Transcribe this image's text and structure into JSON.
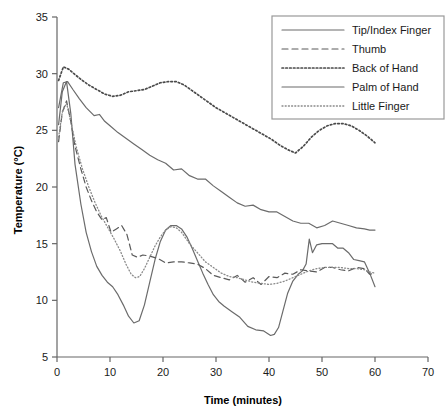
{
  "chart_data": {
    "type": "line",
    "title": "",
    "xlabel": "Time (minutes)",
    "ylabel": "Temperature (°C)",
    "xlim": [
      0,
      70
    ],
    "ylim": [
      5,
      35
    ],
    "xticks": [
      "0",
      "10",
      "20",
      "30",
      "40",
      "50",
      "60",
      "70"
    ],
    "xtick_values": [
      0,
      10,
      20,
      30,
      40,
      50,
      60,
      70
    ],
    "yticks": [
      "5",
      "10",
      "15",
      "20",
      "25",
      "30",
      "35"
    ],
    "ytick_values": [
      5,
      10,
      15,
      20,
      25,
      30,
      35
    ],
    "grid": false,
    "legend_position": "top-right",
    "series": [
      {
        "name": "Tip/Index Finger",
        "style": "solid",
        "color": "#6b6b6b",
        "x": [
          0.3,
          1.0,
          1.8,
          2.6,
          3.4,
          4.5,
          5.5,
          6.5,
          7.5,
          8.5,
          9.5,
          10.5,
          11.5,
          12.5,
          13.5,
          14.5,
          15.5,
          16.5,
          17.5,
          18.5,
          19.5,
          20.5,
          21.5,
          22.5,
          23.5,
          24.5,
          25.5,
          26.5,
          27.5,
          28.5,
          29.5,
          30.5,
          31.5,
          33.0,
          34.5,
          36.0,
          37.5,
          39.0,
          40.3,
          41.0,
          41.8,
          42.6,
          43.5,
          44.5,
          45.5,
          46.3,
          47.0,
          47.6,
          48.2,
          49.0,
          50.0,
          51.0,
          52.0,
          53.0,
          54.0,
          55.0,
          56.0,
          57.0,
          58.0,
          59.0,
          60.0
        ],
        "y": [
          25.5,
          28.4,
          29.3,
          26.5,
          22.0,
          18.5,
          16.0,
          14.3,
          13.0,
          12.2,
          11.6,
          11.2,
          10.5,
          9.6,
          8.6,
          8.0,
          8.2,
          9.6,
          11.6,
          13.6,
          15.2,
          16.2,
          16.6,
          16.6,
          16.3,
          15.6,
          14.6,
          13.5,
          12.4,
          11.4,
          10.5,
          9.9,
          9.5,
          9.0,
          8.5,
          7.7,
          7.4,
          7.3,
          6.9,
          7.0,
          7.6,
          9.0,
          10.6,
          11.7,
          12.3,
          12.6,
          13.2,
          15.4,
          14.2,
          14.9,
          15.0,
          15.0,
          15.0,
          14.6,
          14.6,
          14.2,
          13.6,
          13.5,
          13.4,
          12.4,
          11.2
        ]
      },
      {
        "name": "Thumb",
        "style": "dashed",
        "color": "#5a5a5a",
        "x": [
          0.3,
          1.0,
          1.8,
          2.6,
          3.4,
          4.5,
          5.5,
          6.5,
          7.5,
          8.5,
          9.3,
          10.2,
          11.2,
          12.2,
          13.2,
          14.2,
          15.2,
          16.2,
          17.5,
          19.0,
          20.5,
          22.0,
          23.5,
          25.0,
          26.5,
          28.0,
          29.5,
          31.0,
          32.5,
          34.0,
          35.5,
          37.0,
          38.5,
          40.0,
          41.5,
          43.0,
          44.5,
          46.0,
          47.5,
          49.0,
          50.5,
          52.0,
          53.5,
          55.0,
          56.5,
          58.0,
          59.0,
          60.0
        ],
        "y": [
          24.0,
          26.6,
          27.6,
          25.8,
          23.6,
          21.6,
          20.0,
          18.8,
          17.8,
          17.1,
          17.3,
          16.0,
          16.3,
          16.6,
          15.8,
          14.0,
          13.8,
          14.0,
          13.9,
          13.7,
          13.3,
          13.4,
          13.4,
          13.3,
          13.2,
          12.8,
          12.2,
          12.0,
          11.8,
          12.2,
          11.6,
          12.0,
          11.4,
          12.1,
          12.0,
          12.4,
          12.3,
          12.7,
          12.6,
          12.5,
          12.9,
          12.9,
          12.7,
          12.6,
          12.9,
          12.8,
          12.3,
          12.4
        ]
      },
      {
        "name": "Back of Hand",
        "style": "dotted",
        "color": "#4a4a4a",
        "x": [
          0.3,
          1.2,
          2.2,
          3.2,
          4.5,
          6.0,
          7.5,
          9.0,
          10.5,
          12.0,
          13.5,
          15.0,
          16.5,
          18.0,
          19.5,
          21.0,
          22.5,
          24.0,
          25.5,
          27.0,
          28.5,
          30.0,
          31.5,
          33.0,
          34.5,
          36.0,
          37.5,
          39.0,
          40.5,
          42.0,
          43.5,
          45.0,
          46.5,
          48.0,
          49.5,
          51.0,
          52.5,
          54.0,
          55.5,
          57.0,
          58.5,
          60.0
        ],
        "y": [
          29.4,
          30.6,
          30.4,
          30.0,
          29.5,
          29.0,
          28.6,
          28.2,
          28.0,
          28.1,
          28.4,
          28.5,
          28.6,
          28.9,
          29.2,
          29.3,
          29.3,
          29.0,
          28.5,
          28.0,
          27.5,
          27.0,
          26.6,
          26.2,
          25.8,
          25.4,
          25.0,
          24.6,
          24.2,
          23.7,
          23.3,
          23.0,
          23.6,
          24.4,
          25.0,
          25.4,
          25.6,
          25.6,
          25.4,
          25.0,
          24.5,
          23.9
        ]
      },
      {
        "name": "Palm of Hand",
        "style": "solid",
        "color": "#6b6b6b",
        "x": [
          0.3,
          1.2,
          2.0,
          3.0,
          4.2,
          5.5,
          7.0,
          8.0,
          9.0,
          10.0,
          11.5,
          13.0,
          14.5,
          16.0,
          17.5,
          19.0,
          20.5,
          22.0,
          23.5,
          25.0,
          26.5,
          28.0,
          29.5,
          31.0,
          32.5,
          34.0,
          35.5,
          37.0,
          38.5,
          40.0,
          41.5,
          43.0,
          44.5,
          46.0,
          47.5,
          49.0,
          50.5,
          52.0,
          53.5,
          55.0,
          56.5,
          58.0,
          59.0,
          60.0
        ],
        "y": [
          27.0,
          29.2,
          29.3,
          28.6,
          27.8,
          27.0,
          26.3,
          26.4,
          25.8,
          25.4,
          24.8,
          24.3,
          23.8,
          23.3,
          22.8,
          22.4,
          22.1,
          21.5,
          21.6,
          21.0,
          20.7,
          20.7,
          20.1,
          19.6,
          19.1,
          18.6,
          18.3,
          18.4,
          18.0,
          17.8,
          17.8,
          17.4,
          17.0,
          16.8,
          16.8,
          16.4,
          16.6,
          17.0,
          16.8,
          16.6,
          16.4,
          16.3,
          16.2,
          16.2
        ]
      },
      {
        "name": "Little Finger",
        "style": "fine-dotted",
        "color": "#8a8a8a",
        "x": [
          0.3,
          1.0,
          1.8,
          2.6,
          3.6,
          4.8,
          6.0,
          7.2,
          8.4,
          9.6,
          10.8,
          12.0,
          13.0,
          14.0,
          14.8,
          15.6,
          16.5,
          17.5,
          18.5,
          19.5,
          20.5,
          21.5,
          22.5,
          23.5,
          25.0,
          26.5,
          28.0,
          29.5,
          31.0,
          32.5,
          34.0,
          35.5,
          37.0,
          38.5,
          40.0,
          41.5,
          43.0,
          44.5,
          46.0,
          47.5,
          49.0,
          50.5,
          52.0,
          53.5,
          55.0,
          56.5,
          58.0,
          59.0,
          60.0
        ],
        "y": [
          24.4,
          26.6,
          27.4,
          25.8,
          23.6,
          21.6,
          20.0,
          18.6,
          17.4,
          16.4,
          15.4,
          14.3,
          13.2,
          12.3,
          12.0,
          12.1,
          12.8,
          13.8,
          14.8,
          15.6,
          16.2,
          16.5,
          16.4,
          16.0,
          15.0,
          14.2,
          13.4,
          12.9,
          12.4,
          12.1,
          12.0,
          11.8,
          11.6,
          11.5,
          11.4,
          11.5,
          11.7,
          12.0,
          12.3,
          12.6,
          12.8,
          12.9,
          12.9,
          12.9,
          12.8,
          12.8,
          12.7,
          12.5,
          12.4
        ]
      }
    ]
  },
  "legend": {
    "items": [
      {
        "label": "Tip/Index Finger"
      },
      {
        "label": "Thumb"
      },
      {
        "label": "Back of Hand"
      },
      {
        "label": "Palm of Hand"
      },
      {
        "label": "Little Finger"
      }
    ]
  }
}
